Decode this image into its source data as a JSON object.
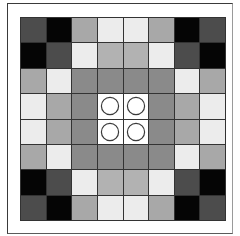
{
  "board": {
    "rows": 8,
    "cols": 8,
    "palette": {
      "K": "#050505",
      "D": "#4c4c4c",
      "M": "#8a8a8a",
      "A": "#a8a8a8",
      "L": "#b2b2b2",
      "V": "#ececec",
      "W": "#ffffff"
    },
    "cells": [
      [
        "D",
        "K",
        "A",
        "V",
        "V",
        "A",
        "K",
        "D"
      ],
      [
        "K",
        "D",
        "V",
        "L",
        "L",
        "V",
        "D",
        "K"
      ],
      [
        "A",
        "V",
        "M",
        "M",
        "M",
        "M",
        "V",
        "A"
      ],
      [
        "V",
        "A",
        "M",
        "W",
        "W",
        "M",
        "A",
        "V"
      ],
      [
        "V",
        "A",
        "M",
        "W",
        "W",
        "M",
        "A",
        "V"
      ],
      [
        "A",
        "V",
        "M",
        "M",
        "M",
        "M",
        "V",
        "A"
      ],
      [
        "K",
        "D",
        "V",
        "L",
        "L",
        "V",
        "D",
        "K"
      ],
      [
        "D",
        "K",
        "A",
        "V",
        "V",
        "A",
        "K",
        "D"
      ]
    ],
    "pieces": [
      {
        "row": 3,
        "col": 3,
        "type": "circle"
      },
      {
        "row": 3,
        "col": 4,
        "type": "circle"
      },
      {
        "row": 4,
        "col": 3,
        "type": "circle"
      },
      {
        "row": 4,
        "col": 4,
        "type": "circle"
      }
    ],
    "piece_stroke": "#3a3a3a",
    "grid_line_color": "#333333"
  }
}
